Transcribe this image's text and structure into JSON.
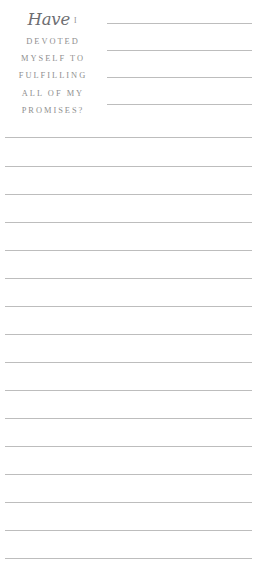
{
  "page": {
    "background_color": "#ffffff",
    "rule_color": "#bdbdbd",
    "text_color": "#8f8f8f",
    "script_color": "#6e6e72"
  },
  "prompt": {
    "script_word": "Have",
    "numeral": "I",
    "lines": [
      "DEVOTED",
      "MYSELF TO",
      "FULFILLING",
      "ALL OF MY",
      "PROMISES?"
    ],
    "full_text": "Have I DEVOTED MYSELF TO FULFILLING ALL OF MY PROMISES?"
  },
  "writing_area": {
    "short_rules": [
      {
        "y": 23
      },
      {
        "y": 50
      },
      {
        "y": 77
      },
      {
        "y": 104
      }
    ],
    "full_rules": [
      {
        "y": 137
      },
      {
        "y": 166
      },
      {
        "y": 194
      },
      {
        "y": 222
      },
      {
        "y": 250
      },
      {
        "y": 278
      },
      {
        "y": 306
      },
      {
        "y": 334
      },
      {
        "y": 362
      },
      {
        "y": 390
      },
      {
        "y": 418
      },
      {
        "y": 446
      },
      {
        "y": 474
      },
      {
        "y": 502
      },
      {
        "y": 530
      },
      {
        "y": 558
      }
    ]
  }
}
